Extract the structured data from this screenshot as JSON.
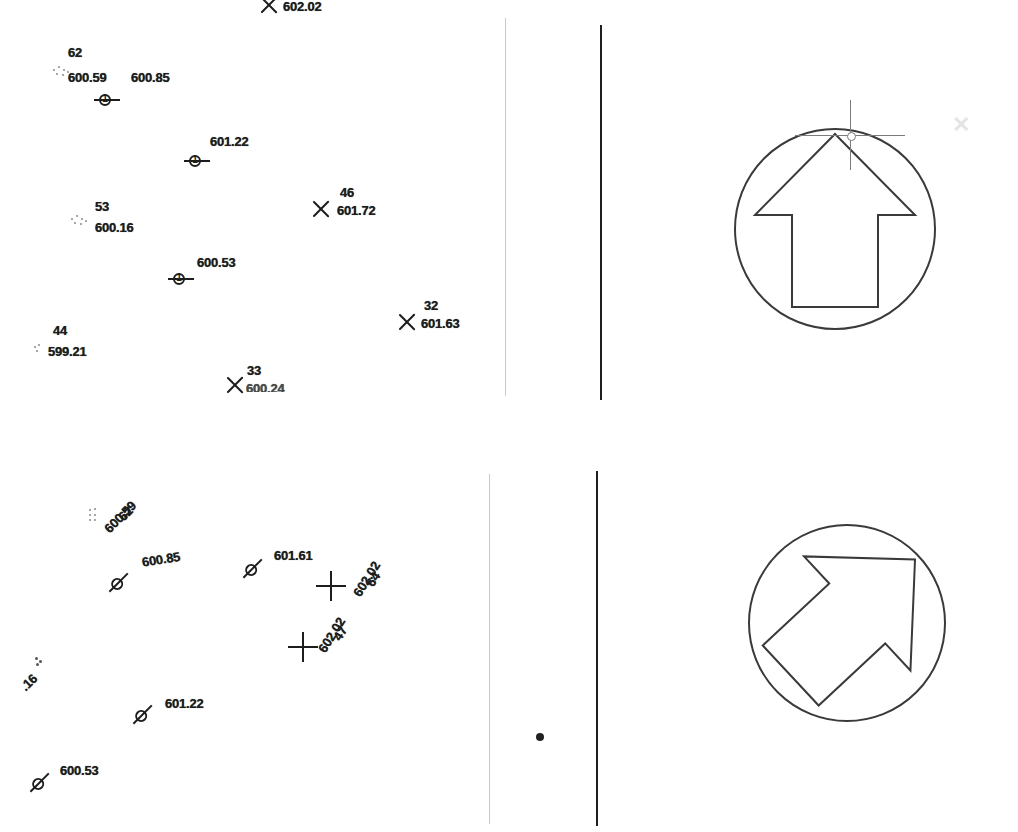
{
  "document": {
    "title": "Survey point elevation plan — scanned drawing",
    "background_color": "#ffffff",
    "ink_color": "#1d1d1d",
    "faint_ink_color": "#c9c9c9"
  },
  "top_clipped_text": "g p g",
  "panels": [
    {
      "name": "upper-panel",
      "rules": [
        {
          "name": "light-rule",
          "color": "#c9c9c9"
        },
        {
          "name": "dark-rule",
          "color": "#1f1f1f"
        }
      ],
      "points": [
        {
          "id": "",
          "elev": "602.02",
          "marker": "x-marker",
          "clipped": true
        },
        {
          "id": "62",
          "elev": "600.59",
          "marker": "dots-marker"
        },
        {
          "id": "",
          "elev": "600.85",
          "marker": "control-point-marker",
          "glyph": "1"
        },
        {
          "id": "",
          "elev": "601.22",
          "marker": "control-point-marker",
          "glyph": "1"
        },
        {
          "id": "46",
          "elev": "601.72",
          "marker": "x-marker"
        },
        {
          "id": "53",
          "elev": "600.16",
          "marker": "dots-marker"
        },
        {
          "id": "",
          "elev": "600.53",
          "marker": "control-point-marker",
          "glyph": "1"
        },
        {
          "id": "32",
          "elev": "601.63",
          "marker": "x-marker"
        },
        {
          "id": "44",
          "elev": "599.21",
          "marker": "dots-marker"
        },
        {
          "id": "33",
          "elev": "600.24",
          "marker": "x-marker",
          "clipped": true
        }
      ],
      "north_arrow": {
        "name": "north-arrow-up",
        "rotation_deg": 0,
        "cursor": "crosshair-cursor"
      }
    },
    {
      "name": "lower-panel",
      "rules": [
        {
          "name": "light-rule",
          "color": "#c9c9c9"
        },
        {
          "name": "dark-rule",
          "color": "#1f1f1f"
        }
      ],
      "points": [
        {
          "id": "62",
          "elev": "600.59",
          "marker": "dots-marker",
          "rotation_deg": -45
        },
        {
          "id": "",
          "elev": "600.85",
          "marker": "control-point-marker",
          "rotation_deg": -45
        },
        {
          "id": "",
          "elev": "601.61",
          "marker": "control-point-marker",
          "rotation_deg": 0
        },
        {
          "id": "64",
          "elev": "602.02",
          "marker": "plus-marker",
          "rotation_deg": -55
        },
        {
          "id": "47",
          "elev": "602.02",
          "marker": "plus-marker",
          "rotation_deg": -55
        },
        {
          "id": "",
          "elev": ".16",
          "marker": "dots-marker",
          "rotation_deg": -45,
          "clipped": true
        },
        {
          "id": "",
          "elev": "601.22",
          "marker": "control-point-marker",
          "rotation_deg": 0
        },
        {
          "id": "",
          "elev": "600.53",
          "marker": "control-point-marker",
          "rotation_deg": 0
        }
      ],
      "center_dot": {
        "name": "center-dot"
      },
      "north_arrow": {
        "name": "north-arrow-rotated",
        "rotation_deg": 45,
        "cursor": null
      }
    }
  ]
}
